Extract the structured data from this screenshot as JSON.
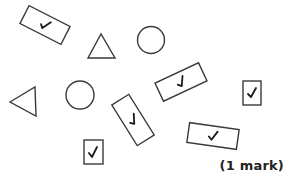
{
  "mark_label": "(1 mark)",
  "colors": {
    "stroke": "#3a3a3a",
    "tick": "#1a1a1a",
    "background": "#ffffff"
  },
  "shapes": [
    {
      "type": "rectangle",
      "ticked": true,
      "orientation": "tilted"
    },
    {
      "type": "triangle",
      "ticked": false
    },
    {
      "type": "circle",
      "ticked": false
    },
    {
      "type": "rectangle",
      "ticked": true,
      "orientation": "tilted"
    },
    {
      "type": "rectangle",
      "ticked": true,
      "orientation": "upright-small"
    },
    {
      "type": "triangle",
      "ticked": false
    },
    {
      "type": "circle",
      "ticked": false
    },
    {
      "type": "rectangle",
      "ticked": true,
      "orientation": "tilted-steep"
    },
    {
      "type": "rectangle",
      "ticked": true,
      "orientation": "upright-small"
    },
    {
      "type": "rectangle",
      "ticked": true,
      "orientation": "slightly-tilted"
    }
  ],
  "tick_symbol": "✓"
}
